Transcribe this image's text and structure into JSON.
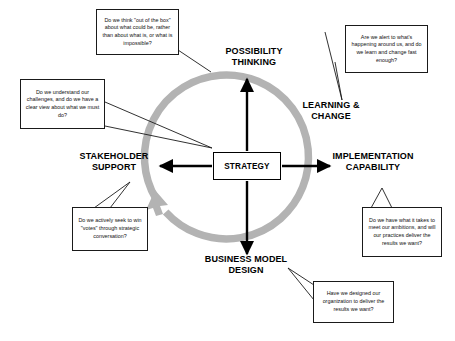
{
  "diagram": {
    "center": {
      "label": "STRATEGY"
    },
    "colors": {
      "cycle_arrow": "#b3b3b3",
      "spoke_arrow": "#000000",
      "text": "#000000",
      "callout_border": "#1a1a1a",
      "background": "#ffffff"
    },
    "nodes": [
      {
        "id": "possibility-thinking",
        "label": "POSSIBILITY\nTHINKING"
      },
      {
        "id": "learning-change",
        "label": "LEARNING &\nCHANGE"
      },
      {
        "id": "implementation-capability",
        "label": "IMPLEMENTATION\nCAPABILITY"
      },
      {
        "id": "business-model-design",
        "label": "BUSINESS MODEL\nDESIGN"
      },
      {
        "id": "stakeholder-support",
        "label": "STAKEHOLDER\nSUPPORT"
      }
    ],
    "callouts": [
      {
        "id": "possibility-thinking-callout",
        "text": "Do we think \"out of the box\" about what could be, rather than about what is, or what is impossible?"
      },
      {
        "id": "learning-change-callout",
        "text": "Are we alert to what's happening around us, and do we learn and change fast enough?"
      },
      {
        "id": "strategy-clarity-callout",
        "text": "Do we understand our challenges, and do we have a clear view about what we must do?"
      },
      {
        "id": "stakeholder-support-callout",
        "text": "Do we actively seek to win \"votes\" through strategic conversation?"
      },
      {
        "id": "implementation-capability-callout",
        "text": "Do we have what it takes to meet our ambitions, and will our practices deliver the results we want?"
      },
      {
        "id": "business-model-design-callout",
        "text": "Have we designed our organization to deliver the results we want?"
      }
    ]
  }
}
